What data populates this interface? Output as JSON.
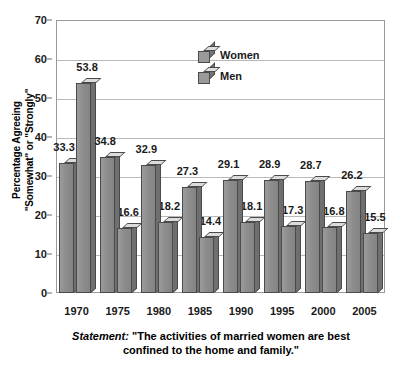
{
  "chart_data": {
    "type": "bar",
    "title": "",
    "subtitle": "",
    "xlabel": "",
    "ylabel": "Percentage Agreeing \"Somewhat\" or \"Strongly\"",
    "ylabel_lines": [
      "Percentage Agreeing",
      "\"Somewhat\" or \"Strongly\""
    ],
    "categories": [
      "1970",
      "1975",
      "1980",
      "1985",
      "1990",
      "1995",
      "2000",
      "2005"
    ],
    "series": [
      {
        "name": "Women",
        "values": [
          33.3,
          34.8,
          32.9,
          27.3,
          29.1,
          28.9,
          28.7,
          26.2
        ]
      },
      {
        "name": "Men",
        "values": [
          53.8,
          16.6,
          18.2,
          14.4,
          18.1,
          17.3,
          16.8,
          15.5
        ]
      }
    ],
    "ylim": [
      0,
      70
    ],
    "yticks": [
      0,
      10,
      20,
      30,
      40,
      50,
      60,
      70
    ],
    "ytick_labels": [
      "0",
      "10",
      "20",
      "30",
      "40",
      "50",
      "60",
      "70"
    ],
    "grid": true,
    "grid_axis": "y",
    "legend": [
      "Women",
      "Men"
    ],
    "legend_position": "inside-top-center",
    "bar_style": "3d",
    "data_labels": true,
    "colors": {
      "bar_front": "#8d8d8d",
      "bar_top": "#dcdcdc",
      "bar_side": "#6f6f6f",
      "bar_outline": "#4a4a4a",
      "gridline": "#b9b9b9",
      "frame": "#9a9a9a",
      "plot_background": "#ffffff",
      "text": "#1a1a1a"
    }
  },
  "caption": {
    "keyword": "Statement:",
    "line1": " \"The activities of married women are best",
    "line2": "confined to the home and family.\""
  }
}
